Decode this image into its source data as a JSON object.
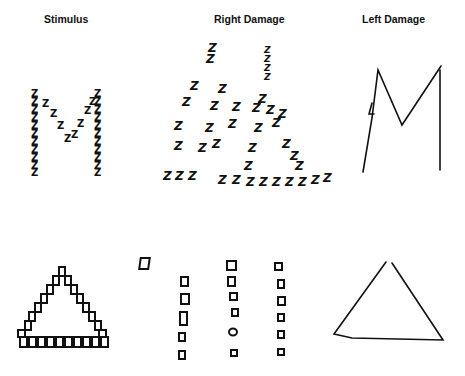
{
  "headers": {
    "stimulus": "Stimulus",
    "right_damage": "Right Damage",
    "left_damage": "Left Damage"
  },
  "rows": [
    {
      "stimulus": "Large letter M composed of small Z characters",
      "right_damage": "Scattered small Z characters, global M shape lost",
      "left_damage": "Large M drawn without small Z details"
    },
    {
      "stimulus": "Large triangle composed of small squares",
      "right_damage": "Three columns of small squares, global triangle lost",
      "left_damage": "Large triangle drawn without small square details"
    }
  ],
  "glyphs": {
    "local_letter": "Z",
    "local_shape": "square"
  }
}
